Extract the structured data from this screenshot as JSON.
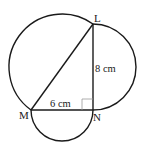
{
  "figure": {
    "type": "geometry",
    "points": {
      "L": {
        "label": "L"
      },
      "M": {
        "label": "M"
      },
      "N": {
        "label": "N"
      }
    },
    "sides": {
      "MN": {
        "length_label": "6 cm"
      },
      "LN": {
        "length_label": "8 cm"
      }
    },
    "right_angle_at": "N"
  }
}
